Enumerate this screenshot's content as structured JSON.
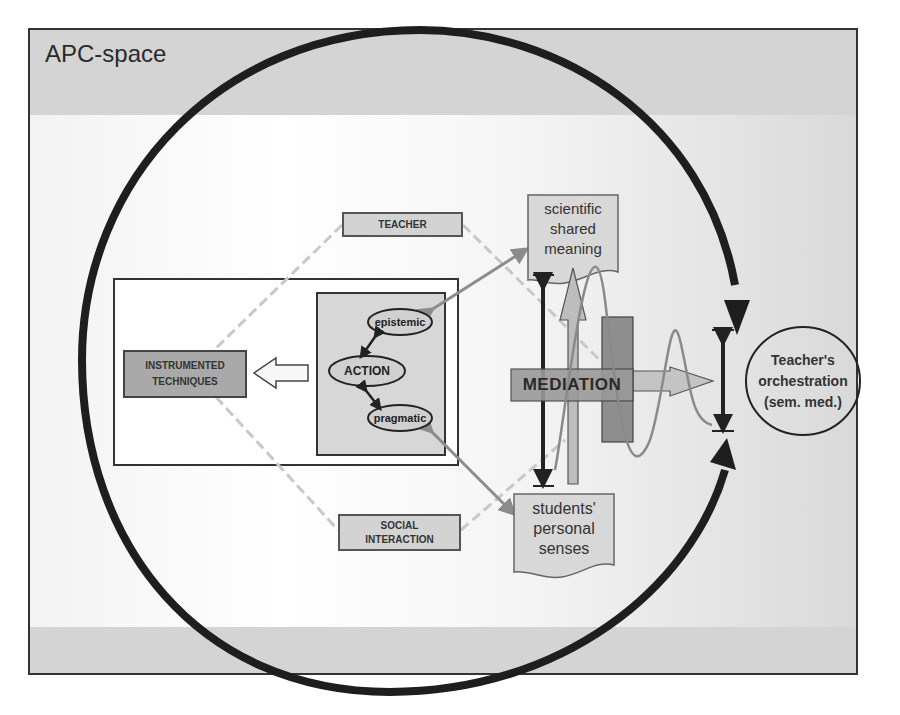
{
  "diagram": {
    "title": "APC-space",
    "nodes": {
      "teacher": "TEACHER",
      "social_interaction_line1": "SOCIAL",
      "social_interaction_line2": "INTERACTION",
      "instrumented_line1": "INSTRUMENTED",
      "instrumented_line2": "TECHNIQUES",
      "action": "ACTION",
      "epistemic": "epistemic",
      "pragmatic": "pragmatic",
      "mediation": "MEDIATION",
      "scientific_line1": "scientific",
      "scientific_line2": "shared",
      "scientific_line3": "meaning",
      "students_line1": "students'",
      "students_line2": "personal",
      "students_line3": "senses",
      "orchestration_line1": "Teacher's",
      "orchestration_line2": "orchestration",
      "orchestration_line3": "(sem. med.)"
    },
    "colors": {
      "frame_fill": "#d4d4d4",
      "circle_stroke": "#1e1e1e",
      "label_box_fill": "#d3d3d3",
      "instrumented_fill": "#a9a9a9",
      "dashed_line": "#c8c8c8",
      "gray_arrow": "#8c8c8c"
    }
  }
}
